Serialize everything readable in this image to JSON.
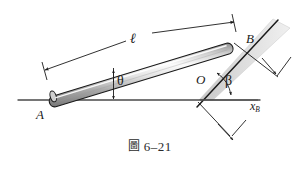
{
  "figure": {
    "caption_prefix": "圖",
    "caption_number": "6–21",
    "caption_full": "圖 6–21",
    "type": "mechanics-free-body-diagram"
  },
  "labels": {
    "point_a": "A",
    "point_b": "B",
    "point_o": "O",
    "rod_length": "ℓ",
    "angle_theta": "θ",
    "angle_beta": "β",
    "distance_xb": "x",
    "distance_xb_sub": "B"
  },
  "colors": {
    "stroke": "#1a1a1a",
    "ground_line": "#555555",
    "rod_light": "#f2f2f2",
    "rod_mid": "#b8b8b8",
    "rod_dark": "#6e6e6e",
    "incline_band": "#d9d9d9",
    "incline_band_edge": "#bdbdbd",
    "dim_line": "#3a3a3a",
    "text": "#1a1a1a"
  },
  "geometry": {
    "point_a": [
      49,
      100
    ],
    "point_b": [
      229,
      47
    ],
    "point_o": [
      199,
      100
    ],
    "rod_angle_deg": 16,
    "incline_angle_deg": 60,
    "ground_y": 100,
    "ground_x_start": 18,
    "ground_x_end": 260
  },
  "annotations": {
    "length_dimension": "ℓ — overall rod length from A to B with arrowheads at both ends",
    "theta_dimension": "θ — angle between rod and horizontal ground, measured at a vertical tick",
    "beta_dimension": "β — angle between inclined surface and horizontal ground at O",
    "xb_dimension": "x_B — horizontal projection distance of point B"
  }
}
